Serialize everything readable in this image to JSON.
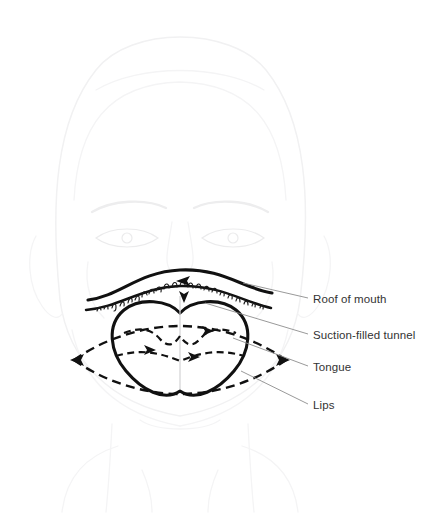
{
  "figure": {
    "kind": "anatomical-line-diagram",
    "background_color": "#ffffff",
    "ink_color": "#111111",
    "ghost_color": "#f1f1f2",
    "leader_color": "#8d8d8d",
    "text_color": "#333333"
  },
  "labels": [
    {
      "id": "roof-of-mouth",
      "text": "Roof of mouth",
      "text_x": 313,
      "text_y": 303,
      "leader_from_x": 308,
      "leader_from_y": 298,
      "leader_to_x": 243,
      "leader_to_y": 283
    },
    {
      "id": "suction-filled-tunnel",
      "text": "Suction-filled tunnel",
      "text_x": 313,
      "text_y": 339,
      "leader_from_x": 308,
      "leader_from_y": 334,
      "leader_to_x": 205,
      "leader_to_y": 303
    },
    {
      "id": "tongue",
      "text": "Tongue",
      "text_x": 313,
      "text_y": 371,
      "leader_from_x": 308,
      "leader_from_y": 366,
      "leader_to_x": 233,
      "leader_to_y": 338
    },
    {
      "id": "lips",
      "text": "Lips",
      "text_x": 313,
      "text_y": 409,
      "leader_from_x": 308,
      "leader_from_y": 404,
      "leader_to_x": 241,
      "leader_to_y": 371
    }
  ],
  "anatomy": {
    "palate_upper_arc": "M 88 300 C 120 296 138 272 180 270 C 222 268 242 288 272 293",
    "palate_lower_arc": "M 86 310 C 120 307 142 287 180 286 C 220 285 244 302 271 308",
    "tongue_outline": "M 180 313 C 168 300 140 297 124 310 C 106 325 110 352 126 371 C 142 390 164 402 180 391 C 196 402 218 390 234 371 C 250 352 254 325 236 310 C 220 297 192 300 180 313 Z",
    "tongue_midline": "M 180 296 L 180 389",
    "tongue_inner_arc_upper": "M 124 333 C 142 326 152 330 160 339 C 168 348 174 345 180 336 C 186 345 192 348 200 339 C 208 330 218 326 236 333",
    "tongue_inner_arc_lower": "M 116 356 C 140 349 158 352 180 361 C 202 352 220 349 244 356",
    "lip_outline_upper": "M 74 360 C 108 336 148 326 180 326 C 212 326 252 336 286 360",
    "lip_outline_lower": "M 74 360 C 108 384 148 394 180 394 C 212 394 252 384 286 360",
    "arrow_left_tip_x": 72,
    "arrow_left_tip_y": 360,
    "arrow_right_tip_x": 288,
    "arrow_right_tip_y": 360
  },
  "face": {
    "head_outline": "M 60 300 C 50 200 56 120 96 70 C 130 26 230 26 266 70 C 306 120 312 200 300 300 C 292 360 250 404 180 416 C 110 404 68 360 60 300 Z",
    "hairline": "M 74 200 C 78 126 108 84 180 82 C 252 84 282 126 286 200",
    "hair_part": "M 96 90 C 140 64 220 64 264 90",
    "left_ear": "M 36 236 C 26 254 28 286 42 306 C 50 318 58 320 62 314",
    "right_ear": "M 324 236 C 334 254 332 286 318 306 C 310 318 302 320 298 314",
    "brow_left": "M 92 212 C 112 200 146 198 166 208",
    "brow_right": "M 194 208 C 214 198 248 200 268 212",
    "eye_left": "M 96 238 C 112 226 142 226 158 238 C 142 250 112 250 96 238 Z",
    "eye_right": "M 202 238 C 218 226 248 226 264 238 C 248 250 218 250 202 238 Z",
    "pupil_left_cx": 127,
    "pupil_left_cy": 238,
    "pupil_right_cx": 233,
    "pupil_right_cy": 238,
    "nose_bridge_left": "M 172 222 C 168 248 164 262 170 270",
    "nose_bridge_right": "M 188 222 C 192 248 196 262 190 270",
    "cheek_left": "M 88 262 C 84 286 92 306 104 318",
    "cheek_right": "M 272 262 C 276 286 268 306 256 318",
    "jaw_left": "M 72 330 C 82 378 116 414 180 426",
    "jaw_right": "M 288 330 C 278 378 244 414 180 426",
    "chin": "M 140 420 C 158 432 202 432 220 420",
    "neck_left": "M 112 424 C 110 464 108 492 106 512",
    "neck_right": "M 248 424 C 250 464 252 492 254 512",
    "shoulder_left": "M 62 512 C 66 478 86 456 118 446",
    "shoulder_right": "M 298 512 C 294 478 274 456 242 446",
    "collar_left": "M 142 470 C 150 488 152 500 152 512",
    "collar_right": "M 218 470 C 210 488 208 500 208 512"
  },
  "rugae_marks": [
    "M 97 311 c 1 -4 3 -5 4 -1",
    "M 104 309 c 2 -5 4 -4 4 0",
    "M 112 308 c 1 -5 4 -6 4 -1 0 3 -1 4 -2 4",
    "M 120 306 c 2 -6 5 -5 4 0",
    "M 128 303 c 1 -6 5 -6 4 -1",
    "M 135 300 c 2 -6 5 -5 4 1",
    "M 142 297 c 0 -6 4 -7 5 -2",
    "M 149 294 c 1 -6 5 -6 5 -1",
    "M 156 291 c 2 -6 6 -5 5 1",
    "M 164 289 c 0 -6 5 -7 5 -1",
    "M 172 287 c 1 -6 5 -6 5 0",
    "M 180 286 c 1 -6 5 -6 5 0",
    "M 188 287 c 1 -6 5 -5 5 1",
    "M 196 288 c 1 -6 5 -5 5 1",
    "M 204 290 c 1 -5 5 -5 5 1",
    "M 212 292 c 1 -5 5 -5 5 1",
    "M 220 295 c 1 -5 5 -4 4 1",
    "M 228 298 c 1 -5 5 -4 4 1",
    "M 236 301 c 1 -5 4 -4 4 1",
    "M 244 304 c 1 -4 4 -4 4 1",
    "M 252 306 c 1 -4 4 -3 3 1",
    "M 260 308 c 1 -4 4 -3 3 1"
  ],
  "arrows": [
    {
      "id": "palate-arrow",
      "x": 186,
      "y": 281,
      "dir": "left"
    },
    {
      "id": "tunnel-arrow",
      "x": 184,
      "y": 299,
      "dir": "down"
    },
    {
      "id": "tongue-right-arrow",
      "x": 210,
      "y": 330,
      "dir": "right"
    },
    {
      "id": "tongue-inner-arrow",
      "x": 196,
      "y": 356,
      "dir": "right"
    },
    {
      "id": "lip-left-arrow",
      "x": 74,
      "y": 360,
      "dir": "left"
    },
    {
      "id": "lip-right-arrow",
      "x": 286,
      "y": 360,
      "dir": "right"
    }
  ]
}
